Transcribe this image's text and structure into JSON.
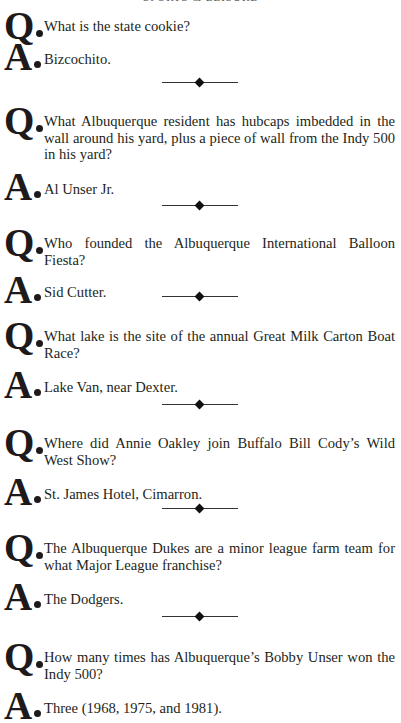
{
  "header": {
    "running_title": "SPORTS & LEISURE"
  },
  "labels": {
    "question": "Q",
    "answer": "A"
  },
  "qa": [
    {
      "question": "What is the state cookie?",
      "answer": "Bizcochito."
    },
    {
      "question": "What Albuquerque resident has hubcaps imbedded in the wall around his yard, plus a piece of wall from the Indy 500 in his yard?",
      "answer": "Al Unser Jr."
    },
    {
      "question": "Who founded the Albuquerque International Balloon Fiesta?",
      "answer": "Sid Cutter."
    },
    {
      "question": "What lake is the site of the annual Great Milk Carton Boat Race?",
      "answer": "Lake Van, near Dexter."
    },
    {
      "question": "Where did Annie Oakley join Buffalo Bill Cody’s Wild West Show?",
      "answer": "St. James Hotel, Cimarron."
    },
    {
      "question": "The Albuquerque Dukes are a minor league farm team for what Major League franchise?",
      "answer": "The Dodgers."
    },
    {
      "question": "How many times has Albuquerque’s Bobby Unser won the Indy 500?",
      "answer": "Three (1968, 1975, and 1981)."
    }
  ]
}
